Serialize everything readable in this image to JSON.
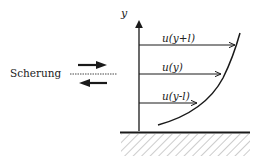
{
  "diagram": {
    "type": "velocity-profile-shear",
    "axis_label": "y",
    "shear_label": "Scherung",
    "velocity_labels": [
      {
        "id": "upper",
        "text": "u(y+l)",
        "y": 45,
        "x_end": 235
      },
      {
        "id": "middle",
        "text": "u(y)",
        "y": 74,
        "x_end": 222
      },
      {
        "id": "lower",
        "text": "u(y-l)",
        "y": 103,
        "x_end": 198
      }
    ],
    "colors": {
      "line": "#1a1a1a",
      "hatch": "#9a9a9a",
      "background": "#ffffff"
    }
  }
}
